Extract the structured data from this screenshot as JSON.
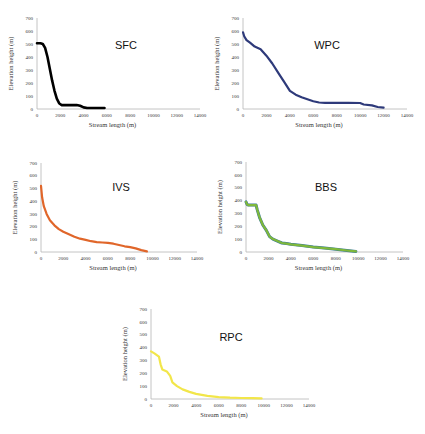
{
  "chart_data": [
    {
      "type": "line",
      "title": "SFC",
      "xlabel": "Stream length (m)",
      "ylabel": "Elevation height (m)",
      "xlim": [
        0,
        14000
      ],
      "ylim": [
        0,
        700
      ],
      "xticks": [
        0,
        2000,
        4000,
        6000,
        8000,
        10000,
        12000,
        14000
      ],
      "yticks": [
        0,
        100,
        200,
        300,
        400,
        500,
        600,
        700
      ],
      "grid": false,
      "legend": "none",
      "color": "#000000",
      "x": [
        0,
        300,
        500,
        700,
        900,
        1100,
        1300,
        1500,
        1700,
        1900,
        2100,
        2300,
        2800,
        3400,
        3700,
        4000,
        4300,
        5000,
        5800
      ],
      "y": [
        505,
        505,
        500,
        470,
        400,
        310,
        220,
        140,
        80,
        45,
        30,
        30,
        30,
        30,
        25,
        12,
        8,
        8,
        8
      ]
    },
    {
      "type": "line",
      "title": "WPC",
      "xlabel": "Stream length (m)",
      "ylabel": "Elevation height (m)",
      "xlim": [
        0,
        14000
      ],
      "ylim": [
        0,
        700
      ],
      "xticks": [
        0,
        2000,
        4000,
        6000,
        8000,
        10000,
        12000,
        14000
      ],
      "yticks": [
        0,
        100,
        200,
        300,
        400,
        500,
        600,
        700
      ],
      "grid": false,
      "legend": "none",
      "color": "#2e3a7a",
      "x": [
        0,
        100,
        300,
        600,
        1000,
        1500,
        2000,
        2500,
        3000,
        3500,
        4000,
        4500,
        5000,
        5500,
        6000,
        6500,
        7000,
        8000,
        9000,
        10000,
        10300,
        11000,
        11500,
        12000
      ],
      "y": [
        590,
        560,
        530,
        510,
        480,
        460,
        410,
        350,
        280,
        210,
        140,
        110,
        90,
        75,
        60,
        50,
        48,
        48,
        48,
        46,
        35,
        28,
        15,
        10
      ]
    },
    {
      "type": "line",
      "title": "IVS",
      "xlabel": "Stream length (m)",
      "ylabel": "Elevation height (m)",
      "xlim": [
        0,
        14000
      ],
      "ylim": [
        0,
        700
      ],
      "xticks": [
        0,
        2000,
        4000,
        6000,
        8000,
        10000,
        12000,
        14000
      ],
      "yticks": [
        0,
        100,
        200,
        300,
        400,
        500,
        600,
        700
      ],
      "grid": false,
      "legend": "none",
      "color": "#e0662a",
      "x": [
        0,
        100,
        250,
        500,
        800,
        1200,
        1600,
        2000,
        2500,
        3000,
        3500,
        4000,
        4500,
        5000,
        5500,
        6000,
        6500,
        7000,
        7500,
        8000,
        8500,
        9000,
        9500
      ],
      "y": [
        520,
        430,
        360,
        300,
        250,
        210,
        180,
        160,
        140,
        120,
        105,
        95,
        85,
        78,
        75,
        72,
        65,
        55,
        45,
        38,
        28,
        15,
        5
      ]
    },
    {
      "type": "line",
      "title": "BBS",
      "xlabel": "Stream length (m)",
      "ylabel": "Elevation height (m)",
      "xlim": [
        0,
        14000
      ],
      "ylim": [
        0,
        700
      ],
      "xticks": [
        0,
        2000,
        4000,
        6000,
        8000,
        10000,
        12000,
        14000
      ],
      "yticks": [
        0,
        100,
        200,
        300,
        400,
        500,
        600,
        700
      ],
      "grid": false,
      "legend": "none",
      "color": "#7fb83a",
      "edge_color": "#3a7a9a",
      "x": [
        0,
        100,
        200,
        900,
        1000,
        1200,
        1500,
        1800,
        2100,
        2400,
        2800,
        3200,
        3600,
        4000,
        5000,
        6000,
        7000,
        8000,
        9000,
        9800
      ],
      "y": [
        390,
        370,
        365,
        365,
        330,
        270,
        210,
        170,
        120,
        100,
        85,
        70,
        65,
        60,
        50,
        38,
        30,
        22,
        12,
        5
      ]
    },
    {
      "type": "line",
      "title": "RPC",
      "xlabel": "Stream length (m)",
      "ylabel": "Elevation height (m)",
      "xlim": [
        0,
        14000
      ],
      "ylim": [
        0,
        700
      ],
      "xticks": [
        0,
        2000,
        4000,
        6000,
        8000,
        10000,
        12000,
        14000
      ],
      "yticks": [
        0,
        100,
        200,
        300,
        400,
        500,
        600,
        700
      ],
      "grid": false,
      "legend": "none",
      "color": "#f2e64a",
      "x": [
        0,
        300,
        700,
        850,
        1000,
        1400,
        1700,
        1900,
        2300,
        2800,
        3400,
        4000,
        5000,
        6000,
        7000,
        8000,
        9000,
        9800
      ],
      "y": [
        370,
        355,
        330,
        270,
        230,
        215,
        180,
        130,
        100,
        75,
        55,
        40,
        25,
        15,
        10,
        8,
        6,
        5
      ]
    }
  ],
  "layout": [
    {
      "x0": 37,
      "x1": 200,
      "yTop": 18,
      "yBot": 109,
      "title_x": 126,
      "title_y": 49
    },
    {
      "x0": 243,
      "x1": 407,
      "yTop": 18,
      "yBot": 109,
      "title_x": 327,
      "title_y": 49
    },
    {
      "x0": 41,
      "x1": 197,
      "yTop": 163,
      "yBot": 252,
      "title_x": 121,
      "title_y": 191
    },
    {
      "x0": 246,
      "x1": 403,
      "yTop": 162,
      "yBot": 252,
      "title_x": 326,
      "title_y": 191
    },
    {
      "x0": 151,
      "x1": 309,
      "yTop": 309,
      "yBot": 399,
      "title_x": 231,
      "title_y": 341
    }
  ]
}
